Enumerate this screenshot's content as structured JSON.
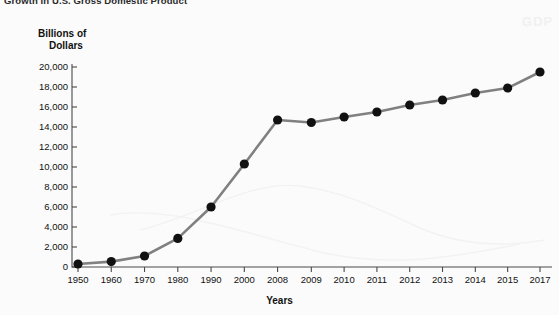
{
  "chart_title": "Growth in U.S. Gross Domestic Product",
  "ghost_watermark": "GDP",
  "axes": {
    "y_title_line1": "Billions of",
    "y_title_line2": "Dollars",
    "x_title": "Years"
  },
  "chart_data": {
    "type": "line",
    "title": "Growth in U.S. Gross Domestic Product",
    "xlabel": "Years",
    "ylabel": "Billions of Dollars",
    "categories": [
      "1950",
      "1960",
      "1970",
      "1980",
      "1990",
      "2000",
      "2008",
      "2009",
      "2010",
      "2011",
      "2012",
      "2013",
      "2014",
      "2015",
      "2017"
    ],
    "values": [
      300,
      540,
      1100,
      2860,
      6000,
      10300,
      14700,
      14450,
      15000,
      15500,
      16200,
      16700,
      17400,
      17900,
      19500
    ],
    "ylim": [
      0,
      20000
    ],
    "ytick_values": [
      0,
      2000,
      4000,
      6000,
      8000,
      10000,
      12000,
      14000,
      16000,
      18000,
      20000
    ],
    "ytick_labels": [
      "0",
      "2,000",
      "4,000",
      "6,000",
      "8,000",
      "10,000",
      "12,000",
      "14,000",
      "16,000",
      "18,000",
      "20,000"
    ],
    "grid": false,
    "legend": "none",
    "line_color": "#808080",
    "marker_color": "#111111",
    "background_color": "#fbfbfb",
    "note": "x-axis spacing is uneven: decades 1950-2000 then annual 2008-2015, 2016 omitted, ending at 2017"
  }
}
